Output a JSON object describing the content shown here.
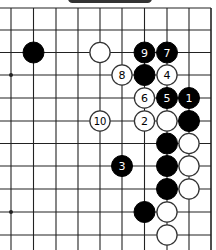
{
  "diagram": {
    "type": "go-board-fragment",
    "grid": {
      "x": [
        11,
        33.5,
        56,
        78,
        100,
        122,
        144.5,
        167,
        189,
        211
      ],
      "y": [
        8,
        30,
        52.5,
        75,
        98,
        121,
        143.5,
        166,
        189,
        212,
        235
      ],
      "left_open": true,
      "bottom_open": true,
      "right_edge": true,
      "top_open": true,
      "star_points": [
        [
          0,
          9
        ],
        [
          0,
          3
        ]
      ]
    },
    "stone_radius": 10.5,
    "colors": {
      "line": "#222222",
      "black": "#000000",
      "white": "#ffffff",
      "black_label": "#ffffff",
      "white_label": "#000000"
    },
    "stones": [
      {
        "c": 1,
        "r": 2,
        "color": "black",
        "label": ""
      },
      {
        "c": 4,
        "r": 2,
        "color": "white",
        "label": ""
      },
      {
        "c": 6,
        "r": 2,
        "color": "black",
        "label": "9"
      },
      {
        "c": 7,
        "r": 2,
        "color": "black",
        "label": "7"
      },
      {
        "c": 5,
        "r": 3,
        "color": "white",
        "label": "8"
      },
      {
        "c": 6,
        "r": 3,
        "color": "black",
        "label": ""
      },
      {
        "c": 7,
        "r": 3,
        "color": "white",
        "label": "4"
      },
      {
        "c": 6,
        "r": 4,
        "color": "white",
        "label": "6"
      },
      {
        "c": 7,
        "r": 4,
        "color": "black",
        "label": "5"
      },
      {
        "c": 8,
        "r": 4,
        "color": "black",
        "label": "1"
      },
      {
        "c": 4,
        "r": 5,
        "color": "white",
        "label": "10"
      },
      {
        "c": 6,
        "r": 5,
        "color": "white",
        "label": "2"
      },
      {
        "c": 7,
        "r": 5,
        "color": "white",
        "label": ""
      },
      {
        "c": 8,
        "r": 5,
        "color": "black",
        "label": ""
      },
      {
        "c": 7,
        "r": 6,
        "color": "black",
        "label": ""
      },
      {
        "c": 8,
        "r": 6,
        "color": "white",
        "label": ""
      },
      {
        "c": 5,
        "r": 7,
        "color": "black",
        "label": "3"
      },
      {
        "c": 7,
        "r": 7,
        "color": "black",
        "label": ""
      },
      {
        "c": 8,
        "r": 7,
        "color": "white",
        "label": ""
      },
      {
        "c": 7,
        "r": 8,
        "color": "black",
        "label": ""
      },
      {
        "c": 8,
        "r": 8,
        "color": "white",
        "label": ""
      },
      {
        "c": 6,
        "r": 9,
        "color": "black",
        "label": ""
      },
      {
        "c": 7,
        "r": 9,
        "color": "white",
        "label": ""
      },
      {
        "c": 7,
        "r": 10,
        "color": "white",
        "label": ""
      }
    ]
  }
}
